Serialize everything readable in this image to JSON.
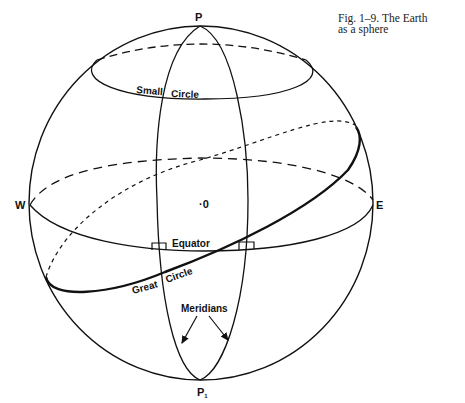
{
  "figure": {
    "caption_line1": "Fig. 1–9.   The Earth",
    "caption_line2": "as a sphere"
  },
  "labels": {
    "north_pole": "P",
    "south_pole": "P",
    "south_pole_sub": "1",
    "west": "W",
    "east": "E",
    "center": "·0",
    "small_circle_a": "Small",
    "small_circle_b": "Circle",
    "equator": "Equator",
    "great_circle_a": "Great",
    "great_circle_b": "Circle",
    "meridians": "Meridians"
  },
  "colors": {
    "stroke": "#111111",
    "background": "#ffffff"
  }
}
